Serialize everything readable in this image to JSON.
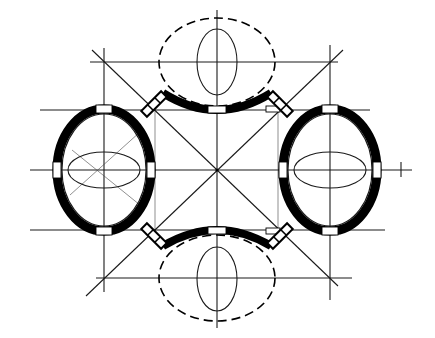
{
  "diagram": {
    "type": "architectural-plan-construction",
    "colors": {
      "ink": "#000000",
      "paper": "#ffffff"
    },
    "center": {
      "x": 217,
      "y": 170
    },
    "grid": {
      "outer_vertical_x": [
        104,
        330
      ],
      "outer_horizontal_y": [
        62,
        278
      ],
      "inner_vertical_x": [
        155,
        278
      ],
      "inner_horizontal_y": [
        110,
        228
      ],
      "center_vertical_x": 217,
      "center_horizontal_y": 170
    },
    "solid_chambers": [
      {
        "name": "left",
        "cx": 104,
        "cy": 170,
        "rx": 49,
        "ry": 63,
        "openings": 4
      },
      {
        "name": "right",
        "cx": 330,
        "cy": 170,
        "rx": 49,
        "ry": 63,
        "openings": 4
      }
    ],
    "dashed_chambers": [
      {
        "name": "top",
        "cx": 217,
        "cy": 62,
        "rx": 58,
        "ry": 45
      },
      {
        "name": "bottom",
        "cx": 217,
        "cy": 278,
        "rx": 58,
        "ry": 45
      }
    ],
    "axis_marker": {
      "symbol": "tick",
      "x": 402,
      "y": 170
    },
    "labels": []
  }
}
